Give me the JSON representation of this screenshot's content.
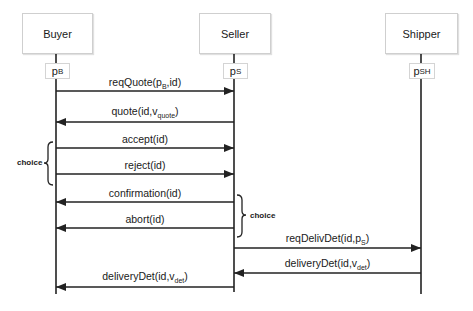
{
  "diagram": {
    "type": "sequence",
    "actors": [
      {
        "name": "Buyer",
        "port": "p",
        "port_sub": "B",
        "x": 56
      },
      {
        "name": "Seller",
        "port": "p",
        "port_sub": "S",
        "x": 234
      },
      {
        "name": "Shipper",
        "port": "p",
        "port_sub": "SH",
        "x": 421
      }
    ],
    "messages": [
      {
        "label": "reqQuote(p",
        "sub": "B",
        "tail": ",id)",
        "from": "Buyer",
        "to": "Seller",
        "y": 91
      },
      {
        "label": "quote(id,v",
        "sub": "quote",
        "tail": ")",
        "from": "Seller",
        "to": "Buyer",
        "y": 122
      },
      {
        "label": "accept(id)",
        "sub": "",
        "tail": "",
        "from": "Buyer",
        "to": "Seller",
        "y": 148
      },
      {
        "label": "reject(id)",
        "sub": "",
        "tail": "",
        "from": "Buyer",
        "to": "Seller",
        "y": 174
      },
      {
        "label": "confirmation(id)",
        "sub": "",
        "tail": "",
        "from": "Seller",
        "to": "Buyer",
        "y": 202
      },
      {
        "label": "abort(id)",
        "sub": "",
        "tail": "",
        "from": "Seller",
        "to": "Buyer",
        "y": 228
      },
      {
        "label": "reqDelivDet(id,p",
        "sub": "S",
        "tail": ")",
        "from": "Seller",
        "to": "Shipper",
        "y": 248
      },
      {
        "label": "deliveryDet(id,v",
        "sub": "det",
        "tail": ")",
        "from": "Shipper",
        "to": "Seller",
        "y": 273
      },
      {
        "label": "deliveryDet(id,v",
        "sub": "det",
        "tail": ")",
        "from": "Seller",
        "to": "Buyer",
        "y": 287
      }
    ],
    "choices": [
      {
        "label": "choice",
        "side": "left",
        "messages": [
          "accept(id)",
          "reject(id)"
        ]
      },
      {
        "label": "choice",
        "side": "right",
        "messages": [
          "confirmation(id)",
          "abort(id)"
        ]
      }
    ],
    "colors": {
      "line": "#222222",
      "box_border": "#cfcfcf"
    }
  }
}
